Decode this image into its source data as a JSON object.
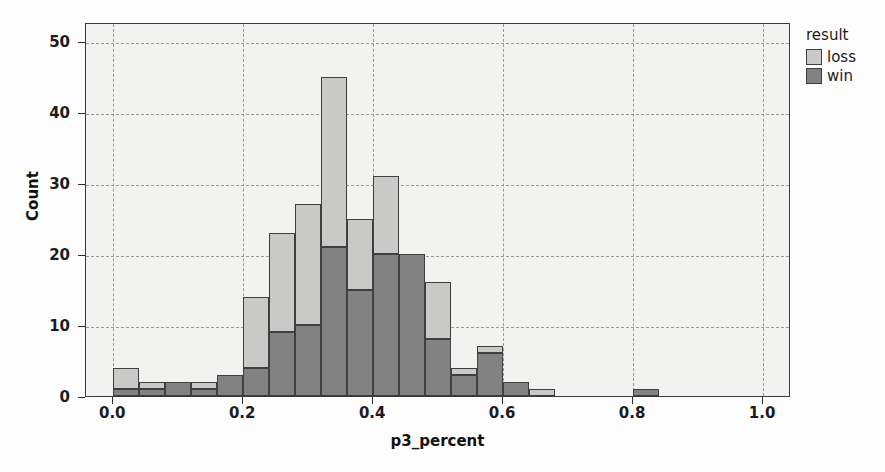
{
  "chart_data": {
    "type": "bar",
    "subtype": "stacked-histogram",
    "title": "",
    "xlabel": "p3_percent",
    "ylabel": "Count",
    "xlim": [
      -0.042,
      1.043
    ],
    "ylim": [
      0,
      52.7
    ],
    "xticks": [
      0.0,
      0.2,
      0.4,
      0.6,
      0.8,
      1.0
    ],
    "xtick_labels": [
      "0.0",
      "0.2",
      "0.4",
      "0.6",
      "0.8",
      "1.0"
    ],
    "yticks": [
      0,
      10,
      20,
      30,
      40,
      50
    ],
    "ytick_labels": [
      "0",
      "10",
      "20",
      "30",
      "40",
      "50"
    ],
    "grid": true,
    "grid_style": "dashed",
    "bin_width": 0.04,
    "bin_starts": [
      0.0,
      0.04,
      0.08,
      0.12,
      0.16,
      0.2,
      0.24,
      0.28,
      0.32,
      0.36,
      0.4,
      0.44,
      0.48,
      0.52,
      0.56,
      0.6,
      0.64,
      0.8
    ],
    "legend_title": "result",
    "legend_position": "right",
    "series": [
      {
        "name": "win",
        "color": "#828282",
        "values": [
          1,
          1,
          2,
          1,
          3,
          4,
          9,
          10,
          21,
          15,
          20,
          20,
          8,
          3,
          6,
          2,
          0,
          1
        ]
      },
      {
        "name": "loss",
        "color": "#c9c9c7",
        "values": [
          3,
          1,
          0,
          1,
          0,
          10,
          14,
          17,
          24,
          10,
          11,
          0,
          8,
          1,
          1,
          0,
          1,
          0
        ]
      }
    ],
    "totals": [
      4,
      2,
      2,
      2,
      3,
      14,
      23,
      27,
      45,
      25,
      31,
      20,
      16,
      4,
      7,
      2,
      1,
      1
    ]
  },
  "axes": {
    "y_title": "Count",
    "x_title": "p3_percent"
  },
  "legend": {
    "title": "result",
    "entries": [
      {
        "label": "loss",
        "color": "#c9c9c7"
      },
      {
        "label": "win",
        "color": "#828282"
      }
    ]
  },
  "colors": {
    "loss": "#c9c9c7",
    "win": "#828282",
    "plot_background": "#f2f2f0",
    "grid": "#9a9a9a",
    "axis": "#3a3a3a"
  }
}
